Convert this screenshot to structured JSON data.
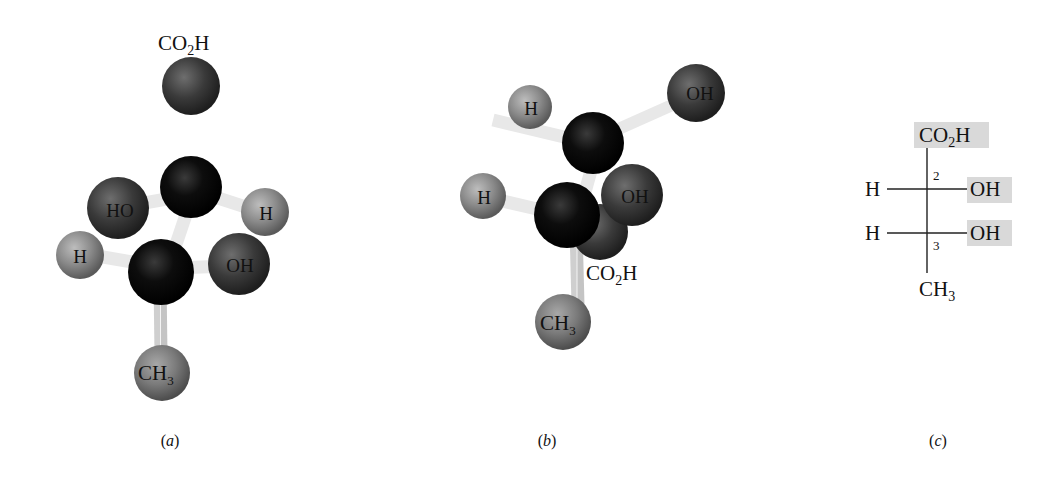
{
  "figure": {
    "panels": [
      {
        "id": "a",
        "caption": "a",
        "type": "ball-and-stick",
        "atoms": [
          {
            "label": "CO2H",
            "label_display": "CO₂H",
            "role": "carboxyl-top",
            "label_position": "above"
          },
          {
            "label": "HO",
            "role": "hydroxyl-c2"
          },
          {
            "label": "H",
            "role": "hydrogen-c2"
          },
          {
            "label": "H",
            "role": "hydrogen-c3"
          },
          {
            "label": "OH",
            "role": "hydroxyl-c3"
          },
          {
            "label": "CH3",
            "label_display": "CH₃",
            "role": "methyl-bottom"
          }
        ],
        "labels": {
          "co2h_main": "CO",
          "co2h_sub": "2",
          "co2h_tail": "H",
          "ho_c2": "HO",
          "h_c2": "H",
          "h_c3": "H",
          "oh_c3": "OH",
          "ch3_main": "CH",
          "ch3_sub": "3"
        }
      },
      {
        "id": "b",
        "caption": "b",
        "type": "ball-and-stick",
        "labels": {
          "h_top": "H",
          "oh_top": "OH",
          "h_mid": "H",
          "oh_mid": "OH",
          "co2h_main": "CO",
          "co2h_sub": "2",
          "co2h_tail": "H",
          "ch3_main": "CH",
          "ch3_sub": "3"
        }
      },
      {
        "id": "c",
        "caption": "c",
        "type": "fischer-projection",
        "top": {
          "main": "CO",
          "sub": "2",
          "tail": "H",
          "highlighted": true
        },
        "rows": [
          {
            "carbon_number": "2",
            "left": "H",
            "right": "OH",
            "right_highlighted": true
          },
          {
            "carbon_number": "3",
            "left": "H",
            "right": "OH",
            "right_highlighted": true
          }
        ],
        "bottom": {
          "main": "CH",
          "sub": "3",
          "highlighted": false
        }
      }
    ],
    "colors": {
      "carbon": "#0a0a0a",
      "oxygen": "#3a3a3a",
      "hydrogen": "#8a8a8a",
      "methyl": "#7a7a7a",
      "bond": "#e6e6e6",
      "highlight": "#d9d9d9"
    }
  },
  "captions": {
    "a_open": "(",
    "a": "a",
    "a_close": ")",
    "b_open": "(",
    "b": "b",
    "b_close": ")",
    "c_open": "(",
    "c": "c",
    "c_close": ")"
  }
}
